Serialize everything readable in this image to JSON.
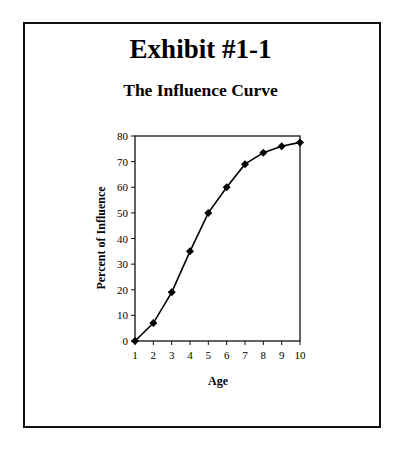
{
  "exhibit": {
    "title": "Exhibit #1-1",
    "subtitle": "The Influence Curve"
  },
  "chart_data": {
    "type": "line",
    "title": "The Influence Curve",
    "xlabel": "Age",
    "ylabel": "Percent of Influence",
    "x": [
      1,
      2,
      3,
      4,
      5,
      6,
      7,
      8,
      9,
      10
    ],
    "series": [
      {
        "name": "Influence",
        "values": [
          0,
          7,
          19,
          35,
          50,
          60,
          69,
          73.5,
          76,
          77.5
        ],
        "marker": "diamond",
        "color": "#000000"
      }
    ],
    "xlim": [
      1,
      10
    ],
    "ylim": [
      0,
      80
    ],
    "xticks": [
      "1",
      "2",
      "3",
      "4",
      "5",
      "6",
      "7",
      "8",
      "9",
      "10"
    ],
    "yticks": [
      "0",
      "10",
      "20",
      "30",
      "40",
      "50",
      "60",
      "70",
      "80"
    ],
    "grid": false,
    "legend": null
  }
}
